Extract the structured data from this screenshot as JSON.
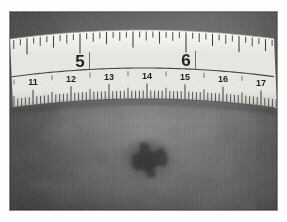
{
  "document": {
    "kind": "clinical-photograph",
    "subject": "skin lesion with measuring tape",
    "color_mode": "grayscale"
  },
  "canvas": {
    "width": 287,
    "height": 222,
    "background": "#fefefe"
  },
  "photo": {
    "x": 10,
    "y": 12,
    "width": 267,
    "height": 198,
    "skin_base_color": "#6f6f6f",
    "skin_shadow_color": "#4a4a4a",
    "skin_highlight_color": "#8e8e8e",
    "border_color": "#8a8a8a"
  },
  "ruler": {
    "label": "measuring-tape",
    "tape_color": "#ebe9e3",
    "tape_shadow_color": "#c8c6bf",
    "tick_color": "#2b2b2b",
    "numeral_color": "#141414",
    "arc_peak_y": 28,
    "arc_edge_drop": 9,
    "top_edge_y": 30,
    "bottom_edge_y": 99,
    "divider_y": 68,
    "scales": [
      {
        "name": "inches",
        "unit": "in",
        "position": "upper",
        "px_per_unit": 106,
        "origin_x": 80,
        "origin_value": 5,
        "subdivisions": 16,
        "numerals": [
          {
            "value": "5",
            "x": 80
          },
          {
            "value": "6",
            "x": 186
          }
        ]
      },
      {
        "name": "centimeters",
        "unit": "cm",
        "position": "lower",
        "px_per_unit": 38,
        "origin_x": 33,
        "origin_value": 11,
        "subdivisions": 10,
        "numerals": [
          {
            "value": "11",
            "x": 33
          },
          {
            "value": "12",
            "x": 71
          },
          {
            "value": "13",
            "x": 109
          },
          {
            "value": "14",
            "x": 147
          },
          {
            "value": "15",
            "x": 185
          },
          {
            "value": "16",
            "x": 223
          },
          {
            "value": "17",
            "x": 261
          }
        ]
      }
    ]
  },
  "lesion": {
    "name": "pigmented-skin-lesion",
    "center_x": 148,
    "center_y": 160,
    "width": 36,
    "height": 32,
    "core_color": "#2f2f2f",
    "mid_color": "#4b4b4b",
    "halo_color": "#5e5e5e"
  }
}
